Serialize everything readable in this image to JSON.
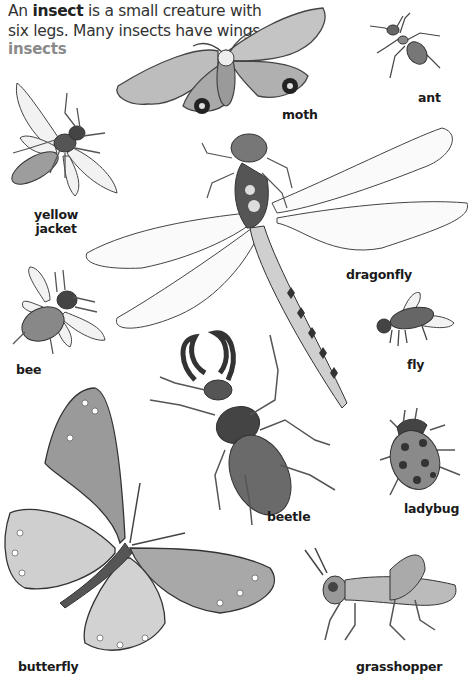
{
  "intro": {
    "prefix": "An ",
    "term": "insect",
    "suffix_line1": " is a small creature with",
    "line2": "six legs. Many insects have wings."
  },
  "section_heading": "insects",
  "insects": [
    {
      "id": "moth",
      "label": "moth"
    },
    {
      "id": "ant",
      "label": "ant"
    },
    {
      "id": "yellow-jacket",
      "label_line1": "yellow",
      "label_line2": "jacket"
    },
    {
      "id": "dragonfly",
      "label": "dragonfly"
    },
    {
      "id": "bee",
      "label": "bee"
    },
    {
      "id": "fly",
      "label": "fly"
    },
    {
      "id": "beetle",
      "label": "beetle"
    },
    {
      "id": "ladybug",
      "label": "ladybug"
    },
    {
      "id": "butterfly",
      "label": "butterfly"
    },
    {
      "id": "grasshopper",
      "label": "grasshopper"
    }
  ],
  "colors": {
    "heading": "#8a8a8a",
    "outline": "#333333",
    "wing_fill": "#f4f4f4",
    "body_dark": "#555555",
    "body_mid": "#999999"
  }
}
